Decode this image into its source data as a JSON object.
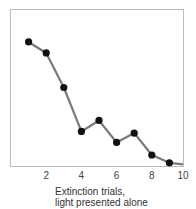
{
  "chart_data": {
    "type": "line",
    "title": "",
    "xlabel": "Extinction trials,\nlight presented alone",
    "xlabel_lines": [
      "Extinction trials,",
      "light presented alone"
    ],
    "ylabel": "",
    "x": [
      1,
      2,
      3,
      4,
      5,
      6,
      7,
      8,
      9,
      10
    ],
    "series": [
      {
        "name": "Response",
        "values": [
          79,
          72,
          50,
          22,
          29,
          15,
          21,
          7,
          2,
          1
        ],
        "markers": [
          true,
          true,
          true,
          true,
          true,
          true,
          true,
          true,
          true,
          false
        ]
      }
    ],
    "xticks": [
      2,
      4,
      6,
      8,
      10
    ],
    "xlim": [
      0,
      10
    ],
    "ylim": [
      0,
      100
    ],
    "grid": false,
    "legend": null,
    "colors": {
      "line": "#7a7a7a",
      "marker": "#111111",
      "frame": "#bdbdbd"
    }
  }
}
